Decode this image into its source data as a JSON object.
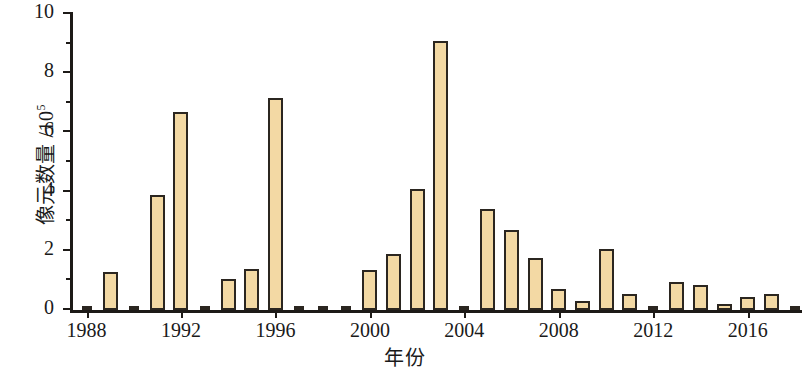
{
  "chart_data": {
    "type": "bar",
    "title": "",
    "xlabel": "年份",
    "ylabel": "像元数量 /10⁵",
    "ylabel_main": "像元数量 /10",
    "ylabel_exponent": "5",
    "xlim": [
      1987.3,
      2018.3
    ],
    "ylim": [
      0,
      10
    ],
    "yticks": [
      0,
      2,
      4,
      6,
      8,
      10
    ],
    "ytick_labels": [
      "0",
      "2",
      "4",
      "6",
      "8",
      "10"
    ],
    "yticks_minor": [
      1,
      3,
      5,
      7,
      9
    ],
    "xticks": [
      1988,
      1992,
      1996,
      2000,
      2004,
      2008,
      2012,
      2016
    ],
    "xtick_labels": [
      "1988",
      "1992",
      "1996",
      "2000",
      "2004",
      "2008",
      "2012",
      "2016"
    ],
    "grid": false,
    "legend": false,
    "bar_fill_color": "#f3d9a4",
    "bar_edge_color": "#2b2620",
    "categories": [
      1988,
      1989,
      1990,
      1991,
      1992,
      1993,
      1994,
      1995,
      1996,
      1997,
      1998,
      1999,
      2000,
      2001,
      2002,
      2003,
      2004,
      2005,
      2006,
      2007,
      2008,
      2009,
      2010,
      2011,
      2012,
      2013,
      2014,
      2015,
      2016,
      2017,
      2018
    ],
    "values": [
      0.12,
      1.3,
      0.1,
      3.9,
      6.7,
      0.15,
      1.05,
      1.4,
      7.15,
      0.02,
      0.12,
      0.02,
      1.35,
      1.9,
      4.1,
      9.1,
      0.1,
      3.4,
      2.7,
      1.75,
      0.7,
      0.3,
      2.05,
      0.55,
      0.15,
      0.95,
      0.85,
      0.2,
      0.45,
      0.55,
      0.06
    ]
  }
}
